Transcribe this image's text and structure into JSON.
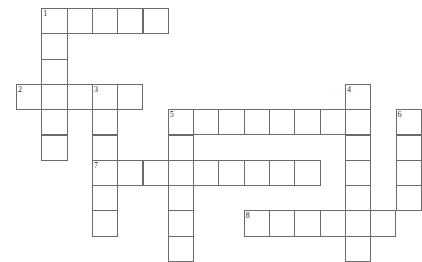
{
  "puzzle": {
    "title": "Crossword Grid",
    "grid": {
      "origin_x": 16,
      "origin_y": 8,
      "cell_size": 25.3,
      "columns": 16,
      "rows": 10,
      "line_color": "#6b6b6b",
      "cell_fill": "#ffffff",
      "background": "#ffffff",
      "number_color": "#2a2a2a"
    },
    "entries": [
      {
        "number": "1",
        "direction": "across",
        "row": 0,
        "col": 1,
        "length": 5
      },
      {
        "number": "1",
        "direction": "down",
        "row": 0,
        "col": 1,
        "length": 6
      },
      {
        "number": "2",
        "direction": "across",
        "row": 3,
        "col": 0,
        "length": 5
      },
      {
        "number": "3",
        "direction": "down",
        "row": 3,
        "col": 3,
        "length": 6
      },
      {
        "number": "4",
        "direction": "down",
        "row": 3,
        "col": 13,
        "length": 7
      },
      {
        "number": "5",
        "direction": "across",
        "row": 4,
        "col": 6,
        "length": 8
      },
      {
        "number": "5",
        "direction": "down",
        "row": 4,
        "col": 6,
        "length": 6
      },
      {
        "number": "6",
        "direction": "down",
        "row": 4,
        "col": 15,
        "length": 5
      },
      {
        "number": "7",
        "direction": "across",
        "row": 6,
        "col": 3,
        "length": 9
      },
      {
        "number": "8",
        "direction": "across",
        "row": 8,
        "col": 9,
        "length": 6
      }
    ],
    "cells": [
      {
        "name": "cell-r0c1",
        "row": 0,
        "col": 1,
        "number": "1",
        "letter": ""
      },
      {
        "name": "cell-r0c2",
        "row": 0,
        "col": 2,
        "number": "",
        "letter": ""
      },
      {
        "name": "cell-r0c3",
        "row": 0,
        "col": 3,
        "number": "",
        "letter": ""
      },
      {
        "name": "cell-r0c4",
        "row": 0,
        "col": 4,
        "number": "",
        "letter": ""
      },
      {
        "name": "cell-r0c5",
        "row": 0,
        "col": 5,
        "number": "",
        "letter": ""
      },
      {
        "name": "cell-r1c1",
        "row": 1,
        "col": 1,
        "number": "",
        "letter": ""
      },
      {
        "name": "cell-r2c1",
        "row": 2,
        "col": 1,
        "number": "",
        "letter": ""
      },
      {
        "name": "cell-r3c0",
        "row": 3,
        "col": 0,
        "number": "2",
        "letter": ""
      },
      {
        "name": "cell-r3c1",
        "row": 3,
        "col": 1,
        "number": "",
        "letter": ""
      },
      {
        "name": "cell-r3c2",
        "row": 3,
        "col": 2,
        "number": "",
        "letter": ""
      },
      {
        "name": "cell-r3c3",
        "row": 3,
        "col": 3,
        "number": "3",
        "letter": ""
      },
      {
        "name": "cell-r3c4",
        "row": 3,
        "col": 4,
        "number": "",
        "letter": ""
      },
      {
        "name": "cell-r3c13",
        "row": 3,
        "col": 13,
        "number": "4",
        "letter": ""
      },
      {
        "name": "cell-r4c1",
        "row": 4,
        "col": 1,
        "number": "",
        "letter": ""
      },
      {
        "name": "cell-r4c3",
        "row": 4,
        "col": 3,
        "number": "",
        "letter": ""
      },
      {
        "name": "cell-r4c6",
        "row": 4,
        "col": 6,
        "number": "5",
        "letter": ""
      },
      {
        "name": "cell-r4c7",
        "row": 4,
        "col": 7,
        "number": "",
        "letter": ""
      },
      {
        "name": "cell-r4c8",
        "row": 4,
        "col": 8,
        "number": "",
        "letter": ""
      },
      {
        "name": "cell-r4c9",
        "row": 4,
        "col": 9,
        "number": "",
        "letter": ""
      },
      {
        "name": "cell-r4c10",
        "row": 4,
        "col": 10,
        "number": "",
        "letter": ""
      },
      {
        "name": "cell-r4c11",
        "row": 4,
        "col": 11,
        "number": "",
        "letter": ""
      },
      {
        "name": "cell-r4c12",
        "row": 4,
        "col": 12,
        "number": "",
        "letter": ""
      },
      {
        "name": "cell-r4c13",
        "row": 4,
        "col": 13,
        "number": "",
        "letter": ""
      },
      {
        "name": "cell-r4c15",
        "row": 4,
        "col": 15,
        "number": "6",
        "letter": ""
      },
      {
        "name": "cell-r5c1",
        "row": 5,
        "col": 1,
        "number": "",
        "letter": ""
      },
      {
        "name": "cell-r5c3",
        "row": 5,
        "col": 3,
        "number": "",
        "letter": ""
      },
      {
        "name": "cell-r5c6",
        "row": 5,
        "col": 6,
        "number": "",
        "letter": ""
      },
      {
        "name": "cell-r5c13",
        "row": 5,
        "col": 13,
        "number": "",
        "letter": ""
      },
      {
        "name": "cell-r5c15",
        "row": 5,
        "col": 15,
        "number": "",
        "letter": ""
      },
      {
        "name": "cell-r6c3",
        "row": 6,
        "col": 3,
        "number": "7",
        "letter": ""
      },
      {
        "name": "cell-r6c4",
        "row": 6,
        "col": 4,
        "number": "",
        "letter": ""
      },
      {
        "name": "cell-r6c5",
        "row": 6,
        "col": 5,
        "number": "",
        "letter": ""
      },
      {
        "name": "cell-r6c6",
        "row": 6,
        "col": 6,
        "number": "",
        "letter": ""
      },
      {
        "name": "cell-r6c7",
        "row": 6,
        "col": 7,
        "number": "",
        "letter": ""
      },
      {
        "name": "cell-r6c8",
        "row": 6,
        "col": 8,
        "number": "",
        "letter": ""
      },
      {
        "name": "cell-r6c9",
        "row": 6,
        "col": 9,
        "number": "",
        "letter": ""
      },
      {
        "name": "cell-r6c10",
        "row": 6,
        "col": 10,
        "number": "",
        "letter": ""
      },
      {
        "name": "cell-r6c11",
        "row": 6,
        "col": 11,
        "number": "",
        "letter": ""
      },
      {
        "name": "cell-r6c13",
        "row": 6,
        "col": 13,
        "number": "",
        "letter": ""
      },
      {
        "name": "cell-r6c15",
        "row": 6,
        "col": 15,
        "number": "",
        "letter": ""
      },
      {
        "name": "cell-r7c3",
        "row": 7,
        "col": 3,
        "number": "",
        "letter": ""
      },
      {
        "name": "cell-r7c6",
        "row": 7,
        "col": 6,
        "number": "",
        "letter": ""
      },
      {
        "name": "cell-r7c13",
        "row": 7,
        "col": 13,
        "number": "",
        "letter": ""
      },
      {
        "name": "cell-r7c15",
        "row": 7,
        "col": 15,
        "number": "",
        "letter": ""
      },
      {
        "name": "cell-r8c3",
        "row": 8,
        "col": 3,
        "number": "",
        "letter": ""
      },
      {
        "name": "cell-r8c6",
        "row": 8,
        "col": 6,
        "number": "",
        "letter": ""
      },
      {
        "name": "cell-r8c9",
        "row": 8,
        "col": 9,
        "number": "8",
        "letter": ""
      },
      {
        "name": "cell-r8c10",
        "row": 8,
        "col": 10,
        "number": "",
        "letter": ""
      },
      {
        "name": "cell-r8c11",
        "row": 8,
        "col": 11,
        "number": "",
        "letter": ""
      },
      {
        "name": "cell-r8c12",
        "row": 8,
        "col": 12,
        "number": "",
        "letter": ""
      },
      {
        "name": "cell-r8c13",
        "row": 8,
        "col": 13,
        "number": "",
        "letter": ""
      },
      {
        "name": "cell-r8c14",
        "row": 8,
        "col": 14,
        "number": "",
        "letter": ""
      },
      {
        "name": "cell-r9c6",
        "row": 9,
        "col": 6,
        "number": "",
        "letter": ""
      },
      {
        "name": "cell-r9c13",
        "row": 9,
        "col": 13,
        "number": "",
        "letter": ""
      }
    ]
  }
}
